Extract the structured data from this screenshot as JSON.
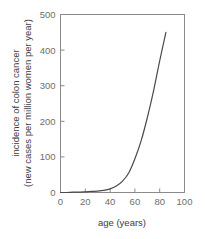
{
  "chart_data": {
    "type": "line",
    "title": "",
    "subtitle": "",
    "xlabel": "age (years)",
    "ylabel_line1": "incidence of colon cancer",
    "ylabel_line2": "(new cases per million women per year)",
    "ylabel": "incidence of colon cancer (new cases per million women per year)",
    "xlim": [
      0,
      100
    ],
    "ylim": [
      0,
      500
    ],
    "xticks": [
      0,
      20,
      40,
      60,
      80,
      100
    ],
    "yticks": [
      0,
      100,
      200,
      300,
      400,
      500
    ],
    "xtick_labels": [
      "0",
      "20",
      "40",
      "60",
      "80",
      "100"
    ],
    "ytick_labels": [
      "0",
      "100",
      "200",
      "300",
      "400",
      "500"
    ],
    "grid": false,
    "legend": false,
    "legend_position": "none",
    "series": [
      {
        "name": "colon cancer incidence",
        "color": "#4a4a4a",
        "x": [
          0,
          5,
          10,
          15,
          20,
          25,
          30,
          35,
          40,
          45,
          50,
          55,
          60,
          65,
          70,
          75,
          80,
          85
        ],
        "y": [
          0,
          0,
          1,
          1,
          2,
          3,
          4,
          6,
          10,
          18,
          32,
          55,
          95,
          145,
          210,
          285,
          370,
          450
        ]
      }
    ],
    "annotations": [],
    "axis_color": "#8a8a8a",
    "tick_label_color": "#6e6e6e",
    "axis_title_color": "#3c3c3c",
    "background_color": "#ffffff"
  }
}
